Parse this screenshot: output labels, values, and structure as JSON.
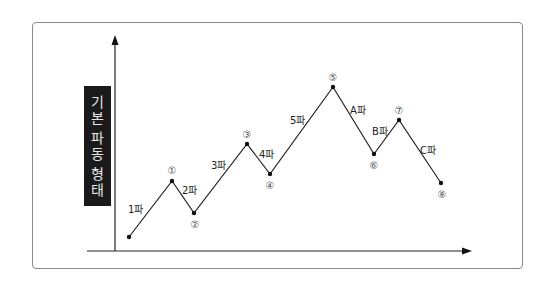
{
  "diagram": {
    "y_axis_title_chars": [
      "기",
      "본",
      "파",
      "동",
      "형",
      "태"
    ],
    "y_axis_title": "기본 파동 형태",
    "colors": {
      "line": "#222222",
      "frame": "#8a8a8a",
      "label_box_bg": "#1a1a1a",
      "label_box_text": "#e8e8e8"
    },
    "points": [
      {
        "id": "start",
        "label": "",
        "x": 129,
        "y": 237
      },
      {
        "id": "p1",
        "label": "①",
        "x": 172,
        "y": 181
      },
      {
        "id": "p2",
        "label": "②",
        "x": 194,
        "y": 213
      },
      {
        "id": "p3",
        "label": "③",
        "x": 247,
        "y": 144
      },
      {
        "id": "p4",
        "label": "④",
        "x": 270,
        "y": 174
      },
      {
        "id": "p5",
        "label": "⑤",
        "x": 333,
        "y": 87
      },
      {
        "id": "p6",
        "label": "⑥",
        "x": 374,
        "y": 154
      },
      {
        "id": "p7",
        "label": "⑦",
        "x": 399,
        "y": 120
      },
      {
        "id": "p8",
        "label": "⑧",
        "x": 441,
        "y": 183
      }
    ],
    "waves": [
      {
        "label": "1파"
      },
      {
        "label": "2파"
      },
      {
        "label": "3파"
      },
      {
        "label": "4파"
      },
      {
        "label": "5파"
      },
      {
        "label": "A파"
      },
      {
        "label": "B파"
      },
      {
        "label": "C파"
      }
    ]
  }
}
